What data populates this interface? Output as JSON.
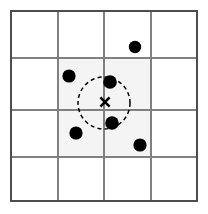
{
  "figure": {
    "width": 208,
    "height": 214,
    "background_color": "#ffffff"
  },
  "grid": {
    "name": "cell-grid",
    "columns": 4,
    "rows": 4,
    "x_lines": [
      11,
      58,
      104,
      151,
      197
    ],
    "y_lines": [
      11,
      58,
      110,
      157,
      201
    ],
    "line_color": "#808080",
    "border_color": "#4d4d4d",
    "line_width": 1.4,
    "border_width": 1.6
  },
  "shaded_region": {
    "name": "highlighted-cells",
    "x": 58,
    "y": 58,
    "width": 93,
    "height": 99,
    "fill_color": "#f4f4f4",
    "label": "candidate cells"
  },
  "query_point": {
    "name": "query-point",
    "glyph": "x-mark",
    "cx": 105,
    "cy": 102,
    "arm": 4.6,
    "color": "#000000"
  },
  "radius_circle": {
    "name": "search-radius-circle",
    "cx": 104,
    "cy": 103,
    "r": 26,
    "stroke_color": "#000000",
    "stroke_width": 1.5,
    "dash": "4 3.2",
    "style": "dashed"
  },
  "data_points": {
    "name": "data-points",
    "fill_color": "#000000",
    "radius": 6.2,
    "points": [
      {
        "id": "p1",
        "cx": 135,
        "cy": 47,
        "r": 6.2,
        "inside_circle": false,
        "cell": "row1-col3"
      },
      {
        "id": "p2",
        "cx": 69,
        "cy": 76,
        "r": 6.6,
        "inside_circle": false,
        "cell": "row2-col2"
      },
      {
        "id": "p3",
        "cx": 110,
        "cy": 82,
        "r": 6.8,
        "inside_circle": true,
        "cell": "row2-col3"
      },
      {
        "id": "p4",
        "cx": 112,
        "cy": 123,
        "r": 6.8,
        "inside_circle": true,
        "cell": "row3-col3"
      },
      {
        "id": "p5",
        "cx": 76,
        "cy": 133,
        "r": 6.6,
        "inside_circle": false,
        "cell": "row3-col2"
      },
      {
        "id": "p6",
        "cx": 140,
        "cy": 145,
        "r": 6.6,
        "inside_circle": false,
        "cell": "row3-col3"
      }
    ]
  }
}
